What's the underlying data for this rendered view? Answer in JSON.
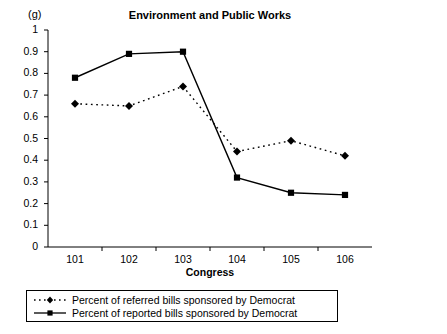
{
  "panel_label": "(g)",
  "chart_data": {
    "type": "line",
    "title": "Environment and Public Works",
    "xlabel": "Congress",
    "ylabel": "",
    "categories": [
      "101",
      "102",
      "103",
      "104",
      "105",
      "106"
    ],
    "ylim": [
      0,
      1
    ],
    "ytick_labels": [
      "0",
      "0.1",
      "0.2",
      "0.3",
      "0.4",
      "0.5",
      "0.6",
      "0.7",
      "0.8",
      "0.9",
      "1"
    ],
    "ytick_values": [
      0,
      0.1,
      0.2,
      0.3,
      0.4,
      0.5,
      0.6,
      0.7,
      0.8,
      0.9,
      1
    ],
    "grid": false,
    "legend_position": "bottom",
    "series": [
      {
        "name": "Percent of referred bills sponsored by Democrat",
        "values": [
          0.66,
          0.65,
          0.74,
          0.44,
          0.49,
          0.42
        ],
        "marker": "diamond",
        "line_style": "dotted",
        "color": "#000000"
      },
      {
        "name": "Percent of reported bills sponsored by Democrat",
        "values": [
          0.78,
          0.89,
          0.9,
          0.32,
          0.25,
          0.24
        ],
        "marker": "square",
        "line_style": "solid",
        "color": "#000000"
      }
    ]
  },
  "legend": [
    {
      "label": "Percent of referred bills sponsored by Democrat",
      "key": "dotted-diamond-key"
    },
    {
      "label": "Percent of reported bills sponsored by Democrat",
      "key": "solid-square-key"
    }
  ]
}
